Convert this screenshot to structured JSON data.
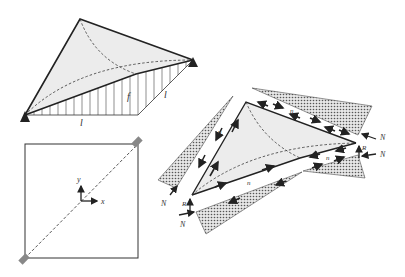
{
  "figure": {
    "panel_a": {
      "description": "Hyperbolic paraboloid shell on two supports with vertical hatched projection",
      "labels": {
        "rise": "f",
        "span_bottom": "l",
        "span_side": "l"
      }
    },
    "panel_b": {
      "description": "Plan view square with diagonal supports and coordinate axes",
      "labels": {
        "x_axis": "x",
        "y_axis": "y"
      }
    },
    "panel_c": {
      "description": "Exploded view with edge beams and shear forces",
      "labels": {
        "shear": "n",
        "normal_force": "N",
        "reaction": "R"
      }
    },
    "colors": {
      "shell_fill": "#ececec",
      "stipple": "#555555",
      "line": "#222222",
      "support": "#222222",
      "support_plan": "#888888"
    }
  }
}
